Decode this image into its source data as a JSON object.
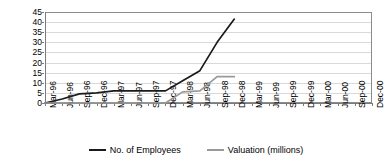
{
  "chart_data": {
    "type": "line",
    "title": "",
    "subtitle": "",
    "xlabel": "",
    "ylabel": "",
    "ylim": [
      0,
      45
    ],
    "ytick_step": 5,
    "yticks": [
      "45",
      "40",
      "35",
      "30",
      "25",
      "20",
      "15",
      "10",
      "5",
      "0"
    ],
    "grid": "horizontal",
    "legend_position": "bottom-center",
    "categories": [
      "Mar-96",
      "Jun-96",
      "Sep-96",
      "Dec-96",
      "Mar-97",
      "Jun-97",
      "Sep-97",
      "Dec-97",
      "Mar-98",
      "Jun-98",
      "Sep-98",
      "Dec-98",
      "Mar-99",
      "Jun-99",
      "Sep-99",
      "Dec-99",
      "Mar-00",
      "Jun-00",
      "Sep-00",
      "Dec-00"
    ],
    "series": [
      {
        "name": "No. of Employees",
        "color": "#1a1a1a",
        "values": [
          0,
          2,
          4.5,
          5,
          6,
          6,
          6,
          6,
          11,
          16,
          30,
          41.5,
          null,
          null,
          null,
          null,
          null,
          null,
          null,
          null
        ]
      },
      {
        "name": "Valuation (millions)",
        "color": "#9a9a9a",
        "values": [
          0,
          0,
          0,
          0,
          0,
          0,
          0,
          0,
          5.5,
          6,
          13,
          13,
          null,
          null,
          null,
          null,
          null,
          null,
          null,
          null
        ]
      }
    ],
    "legend": [
      {
        "label": "No. of Employees",
        "color": "#1a1a1a",
        "marker": "line-dark"
      },
      {
        "label": "Valuation (millions)",
        "color": "#9a9a9a",
        "marker": "line-gray"
      }
    ]
  }
}
